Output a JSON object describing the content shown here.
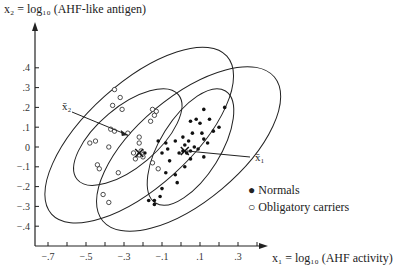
{
  "chart_data": {
    "type": "scatter",
    "title": "",
    "ylabel": "x2 = log10 (AHF-like antigen)",
    "xlabel": "x1 = log10 (AHF activity)",
    "xlim": [
      -0.75,
      0.45
    ],
    "ylim": [
      -0.5,
      0.6
    ],
    "x_ticks": [
      "-.7",
      "-.5",
      "-.3",
      "-.1",
      ".1",
      ".3"
    ],
    "y_ticks": [
      ".4",
      ".3",
      ".2",
      ".1",
      "0",
      "-.1",
      "-.2",
      "-.3",
      "-.4"
    ],
    "legend": [
      {
        "marker": "filled-circle",
        "label": "Normals"
      },
      {
        "marker": "open-circle",
        "label": "Obligatory carriers"
      }
    ],
    "annotations": [
      {
        "text": "x̄1",
        "target": "mean of Normals",
        "point": [
          0.02,
          -0.02
        ]
      },
      {
        "text": "x̄2",
        "target": "mean of Obligatory carriers",
        "point": [
          -0.25,
          0.05
        ]
      }
    ],
    "series": [
      {
        "name": "Normals",
        "marker": "filled",
        "points": [
          [
            0.23,
            0.2
          ],
          [
            0.12,
            0.19
          ],
          [
            0.08,
            0.14
          ],
          [
            0.05,
            0.13
          ],
          [
            0.15,
            0.14
          ],
          [
            0.1,
            0.12
          ],
          [
            0.2,
            0.1
          ],
          [
            0.17,
            0.08
          ],
          [
            0.06,
            0.07
          ],
          [
            0.11,
            0.07
          ],
          [
            0.01,
            0.05
          ],
          [
            0.12,
            0.04
          ],
          [
            0.14,
            0.02
          ],
          [
            0.04,
            0.03
          ],
          [
            0.07,
            0.0
          ],
          [
            0.02,
            0.01
          ],
          [
            -0.03,
            0.03
          ],
          [
            0.09,
            -0.01
          ],
          [
            0.01,
            -0.02
          ],
          [
            -0.01,
            -0.03
          ],
          [
            0.03,
            -0.03
          ],
          [
            0.05,
            -0.02
          ],
          [
            0.12,
            -0.05
          ],
          [
            -0.12,
            0.03
          ],
          [
            -0.08,
            0.02
          ],
          [
            -0.07,
            -0.01
          ],
          [
            -0.1,
            -0.03
          ],
          [
            -0.06,
            -0.07
          ],
          [
            0.05,
            -0.06
          ],
          [
            0.02,
            -0.1
          ],
          [
            -0.08,
            -0.13
          ],
          [
            -0.03,
            -0.14
          ],
          [
            -0.02,
            -0.18
          ],
          [
            -0.1,
            -0.21
          ],
          [
            -0.11,
            -0.25
          ],
          [
            -0.14,
            -0.27
          ],
          [
            -0.17,
            -0.27
          ],
          [
            -0.14,
            -0.29
          ],
          [
            -0.19,
            -0.03
          ]
        ]
      },
      {
        "name": "Obligatory carriers",
        "marker": "open",
        "points": [
          [
            -0.35,
            0.29
          ],
          [
            -0.32,
            0.25
          ],
          [
            -0.36,
            0.21
          ],
          [
            -0.31,
            0.19
          ],
          [
            -0.15,
            0.19
          ],
          [
            -0.13,
            0.18
          ],
          [
            -0.14,
            0.16
          ],
          [
            -0.16,
            0.13
          ],
          [
            -0.37,
            0.09
          ],
          [
            -0.35,
            0.08
          ],
          [
            -0.28,
            0.07
          ],
          [
            -0.45,
            0.03
          ],
          [
            -0.22,
            0.05
          ],
          [
            -0.22,
            0.02
          ],
          [
            -0.38,
            0.0
          ],
          [
            -0.25,
            -0.03
          ],
          [
            -0.22,
            -0.04
          ],
          [
            -0.2,
            -0.05
          ],
          [
            -0.24,
            -0.06
          ],
          [
            -0.21,
            -0.02
          ],
          [
            -0.48,
            0.02
          ],
          [
            -0.44,
            -0.09
          ],
          [
            -0.43,
            -0.11
          ],
          [
            -0.33,
            -0.13
          ],
          [
            -0.41,
            -0.24
          ],
          [
            -0.38,
            -0.28
          ],
          [
            -0.15,
            -0.08
          ],
          [
            -0.12,
            -0.11
          ]
        ]
      }
    ],
    "ellipses_note": "Inner and outer confidence ellipses for each group, tilted along positive correlation",
    "grid": false,
    "legend_position": "right-center"
  },
  "labels": {
    "y_axis": "x₂ = log₁₀ (AHF-like antigen)",
    "x_axis": "x₁ = log₁₀ (AHF activity)",
    "mean1": "x̄₁",
    "mean2": "x̄₂",
    "legend_normals": "Normals",
    "legend_carriers": "Obligatory carriers"
  }
}
